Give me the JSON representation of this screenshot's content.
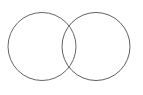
{
  "canvas": {
    "width": 143,
    "height": 95,
    "background_color": "#ffffff"
  },
  "figure": {
    "name": "two-overlapping-circles",
    "stroke_color": "#666666",
    "stroke_width": 1,
    "fill": "none",
    "shapes": [
      {
        "id": "left-circle",
        "type": "circle",
        "cx": 42,
        "cy": 46.5,
        "r": 34,
        "stroke_color": "#666666",
        "fill": "none"
      },
      {
        "id": "right-circle",
        "type": "circle",
        "cx": 96,
        "cy": 46.5,
        "r": 34,
        "stroke_color": "#5f5f5f",
        "fill": "none"
      }
    ],
    "intersection_points": [
      {
        "x": 72,
        "y": 23
      },
      {
        "x": 72,
        "y": 70
      }
    ]
  }
}
